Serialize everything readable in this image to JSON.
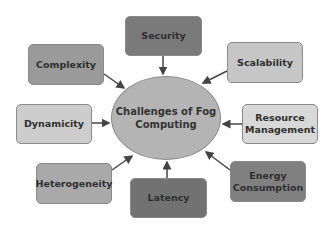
{
  "diagram": {
    "center": "Challenges of Fog Computing",
    "nodes": [
      {
        "id": "security",
        "label": "Security",
        "color": "#7a7a7a"
      },
      {
        "id": "complexity",
        "label": "Complexity",
        "color": "#9a9a9a"
      },
      {
        "id": "scalability",
        "label": "Scalability",
        "color": "#c6c6c6"
      },
      {
        "id": "dynamicity",
        "label": "Dynamicity",
        "color": "#cdcdcd"
      },
      {
        "id": "resource-management",
        "label": "Resource Management",
        "color": "#d8d8d8"
      },
      {
        "id": "heterogeneity",
        "label": "Heterogeneity",
        "color": "#a9a9a9"
      },
      {
        "id": "latency",
        "label": "Latency",
        "color": "#727272"
      },
      {
        "id": "energy-consumption",
        "label": "Energy Consumption",
        "color": "#808080"
      }
    ]
  }
}
